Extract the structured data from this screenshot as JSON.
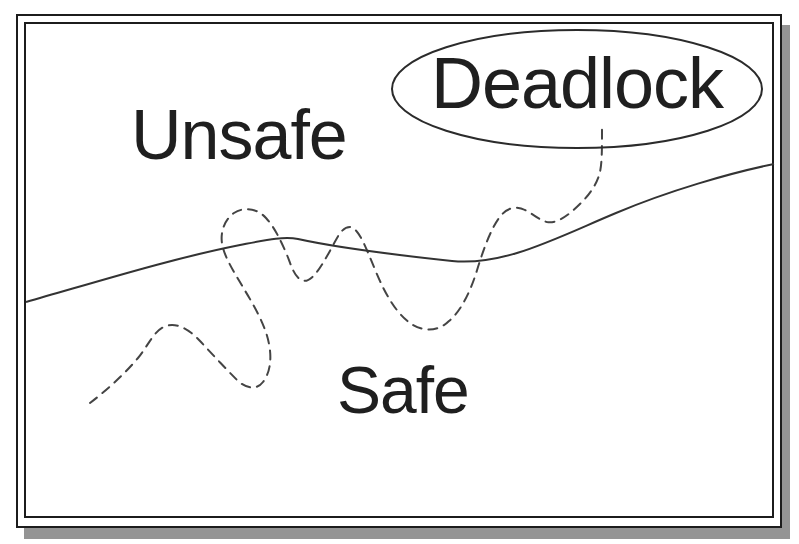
{
  "figure": {
    "labels": {
      "unsafe": "Unsafe",
      "safe": "Safe",
      "deadlock": "Deadlock"
    },
    "colors": {
      "ink": "#1f1f1f",
      "boundary_line": "#333333",
      "trajectory_line": "#444444",
      "ellipse_line": "#2b2b2b",
      "shadow": "#949494",
      "background": "#ffffff"
    }
  }
}
